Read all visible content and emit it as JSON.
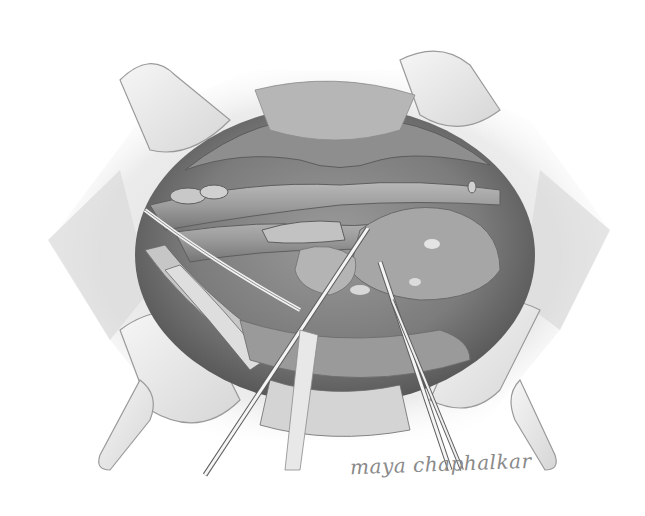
{
  "illustration": {
    "subject": "surgical-field-illustration",
    "style": "graphite pencil, grayscale",
    "signature": "maya chaphalkar",
    "colors": {
      "background": "#ffffff",
      "skin_retractor": "#ececec",
      "cavity_dark": "#6e6e6e",
      "tissue_mid": "#8c8c8c",
      "vessel": "#a4a4a4",
      "highlight": "#e2e2e2",
      "instrument": "#f4f4f4",
      "outline": "#5a5a5a"
    }
  }
}
